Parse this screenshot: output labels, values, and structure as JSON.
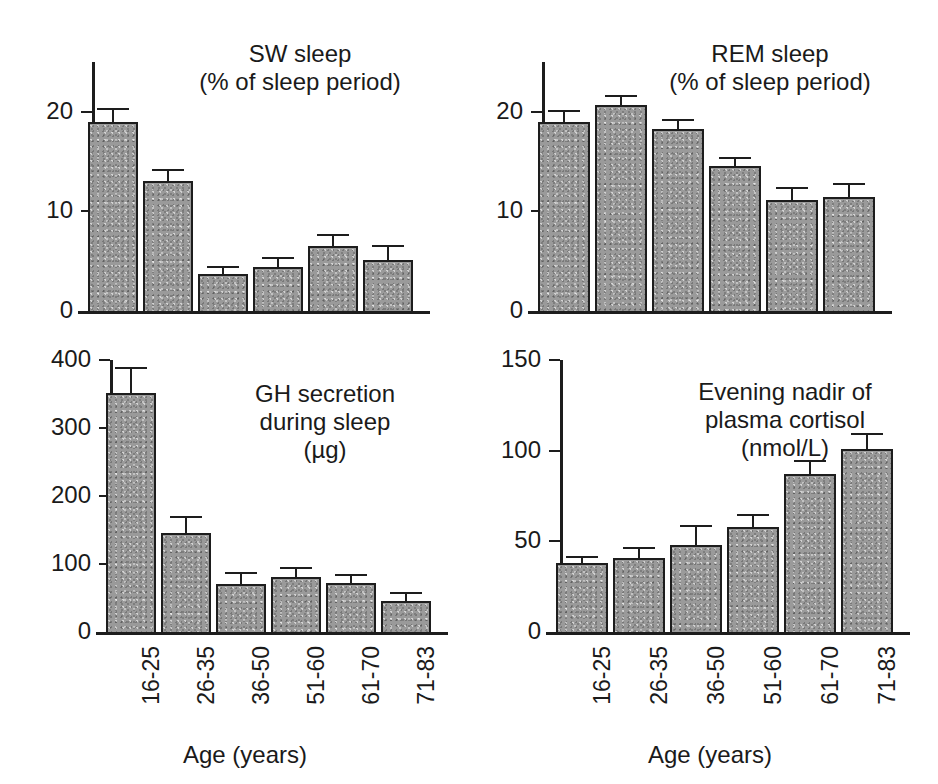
{
  "figure": {
    "categories": [
      "16-25",
      "26-35",
      "36-50",
      "51-60",
      "61-70",
      "71-83"
    ],
    "x_axis_title": "Age (years)",
    "bar_fill_color": "#9a9a9a",
    "bar_edge_color": "#1d1d1d"
  },
  "chart_data": [
    {
      "id": "sw-sleep",
      "type": "bar",
      "title": "SW sleep",
      "subtitle": "(% of sleep period)",
      "xlabel": "Age (years)",
      "ylabel": "",
      "categories": [
        "16-25",
        "26-35",
        "36-50",
        "51-60",
        "61-70",
        "71-83"
      ],
      "values": [
        19.0,
        13.1,
        3.7,
        4.4,
        6.5,
        5.1
      ],
      "errors": [
        1.4,
        1.2,
        0.8,
        1.0,
        1.2,
        1.5
      ],
      "ylim": [
        0,
        25
      ],
      "yticks": [
        0,
        10,
        20
      ],
      "ytick_labels": [
        "0",
        "10",
        "20"
      ],
      "grid": false,
      "legend": "none"
    },
    {
      "id": "rem-sleep",
      "type": "bar",
      "title": "REM sleep",
      "subtitle": "(% of sleep period)",
      "xlabel": "Age (years)",
      "ylabel": "",
      "categories": [
        "16-25",
        "26-35",
        "36-50",
        "51-60",
        "61-70",
        "71-83"
      ],
      "values": [
        19.0,
        20.7,
        18.3,
        14.6,
        11.1,
        11.4
      ],
      "errors": [
        1.2,
        1.0,
        1.0,
        0.9,
        1.3,
        1.5
      ],
      "ylim": [
        0,
        25
      ],
      "yticks": [
        0,
        10,
        20
      ],
      "ytick_labels": [
        "0",
        "10",
        "20"
      ],
      "grid": false,
      "legend": "none"
    },
    {
      "id": "gh-secretion",
      "type": "bar",
      "title": "GH secretion",
      "subtitle": "during sleep",
      "subtitle2": "(µg)",
      "xlabel": "Age (years)",
      "ylabel": "",
      "categories": [
        "16-25",
        "26-35",
        "36-50",
        "51-60",
        "61-70",
        "71-83"
      ],
      "values": [
        351,
        145,
        70,
        81,
        72,
        46
      ],
      "errors": [
        38,
        25,
        18,
        15,
        14,
        13
      ],
      "ylim": [
        0,
        400
      ],
      "yticks": [
        0,
        100,
        200,
        300,
        400
      ],
      "ytick_labels": [
        "0",
        "100",
        "200",
        "300",
        "400"
      ],
      "grid": false,
      "legend": "none"
    },
    {
      "id": "cortisol-nadir",
      "type": "bar",
      "title": "Evening nadir of",
      "subtitle": "plasma cortisol",
      "subtitle2": "(nmol/L)",
      "xlabel": "Age (years)",
      "ylabel": "",
      "categories": [
        "16-25",
        "26-35",
        "36-50",
        "51-60",
        "61-70",
        "71-83"
      ],
      "values": [
        38,
        41,
        48,
        58,
        87,
        101
      ],
      "errors": [
        4,
        6,
        11,
        7,
        8,
        9
      ],
      "ylim": [
        0,
        150
      ],
      "yticks": [
        0,
        50,
        100,
        150
      ],
      "ytick_labels": [
        "0",
        "50",
        "100",
        "150"
      ],
      "grid": false,
      "legend": "none"
    }
  ]
}
